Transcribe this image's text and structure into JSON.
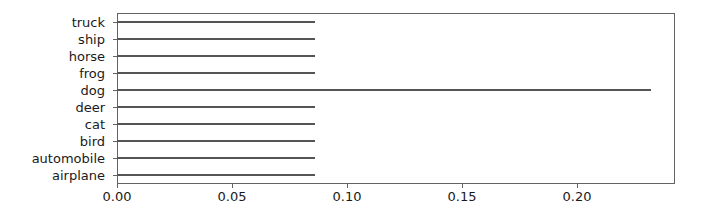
{
  "chart_data": {
    "type": "bar",
    "orientation": "horizontal",
    "title": "",
    "xlabel": "",
    "ylabel": "",
    "categories": [
      "airplane",
      "automobile",
      "bird",
      "cat",
      "deer",
      "dog",
      "frog",
      "horse",
      "ship",
      "truck"
    ],
    "values": [
      0.086,
      0.086,
      0.086,
      0.086,
      0.086,
      0.232,
      0.086,
      0.086,
      0.086,
      0.086
    ],
    "series": [
      {
        "name": "",
        "values": [
          0.086,
          0.086,
          0.086,
          0.086,
          0.086,
          0.232,
          0.086,
          0.086,
          0.086,
          0.086
        ]
      }
    ],
    "xlim": [
      0.0,
      0.2426
    ],
    "xticks": [
      0.0,
      0.05,
      0.1,
      0.15,
      0.2
    ],
    "xticklabels": [
      "0.00",
      "0.05",
      "0.10",
      "0.15",
      "0.20"
    ],
    "yticklabels_top_to_bottom": [
      "truck",
      "ship",
      "horse",
      "frog",
      "dog",
      "deer",
      "cat",
      "bird",
      "automobile",
      "airplane"
    ],
    "grid": false,
    "legend": null,
    "bar_color": "#555555",
    "axes_color": "#636363"
  }
}
